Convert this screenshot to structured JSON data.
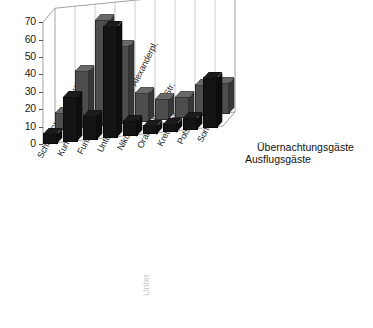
{
  "chart_data": {
    "type": "bar",
    "title": "",
    "subtitle": "",
    "xlabel": "",
    "ylabel": "",
    "ylim": [
      0,
      70
    ],
    "yticks": [
      0,
      10,
      20,
      30,
      40,
      50,
      60,
      70
    ],
    "grid": true,
    "projection": "3d",
    "legend_position": "right",
    "categories": [
      "Schloß Charlottenburg",
      "Kurfürstendamm",
      "Funkturm",
      "Unter den Linden / Alexanderpl.",
      "Nikolaiviertel",
      "Oranienburger Str.",
      "Kreuzberg",
      "Potsdam",
      "Sonstiges"
    ],
    "series": [
      {
        "name": "Übernachtungsgäste",
        "color": "#4d4d4d",
        "values": [
          9,
          32,
          60,
          44,
          16,
          11,
          11,
          17,
          17
        ]
      },
      {
        "name": "Ausflugsgäste",
        "color": "#141414",
        "values": [
          5,
          25,
          13,
          63,
          8,
          4,
          4,
          6,
          28
        ]
      }
    ]
  },
  "legend": {
    "entries": [
      {
        "label": "Übernachtungsgäste"
      },
      {
        "label": "Ausflugsgäste"
      }
    ]
  },
  "caption": {
    "text": "Unter"
  }
}
